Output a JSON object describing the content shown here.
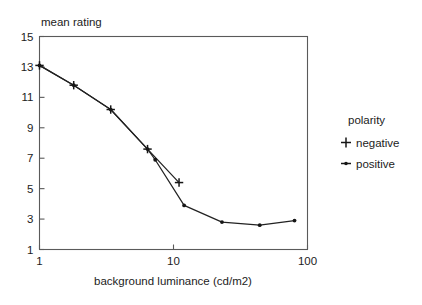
{
  "chart_data": {
    "type": "line",
    "title": "",
    "xlabel": "background luminance (cd/m2)",
    "ylabel": "mean rating",
    "xscale": "log",
    "yscale": "linear",
    "xlim": [
      1,
      100
    ],
    "ylim": [
      1,
      15
    ],
    "xticks": [
      "1",
      "10",
      "100"
    ],
    "xtick_values": [
      1,
      10,
      100
    ],
    "yticks": [
      "15",
      "13",
      "11",
      "9",
      "7",
      "5",
      "3",
      "1"
    ],
    "ytick_values": [
      15,
      13,
      11,
      9,
      7,
      5,
      3,
      1
    ],
    "grid": false,
    "legend_position": "right",
    "legend_title": "polarity",
    "series": [
      {
        "name": "negative",
        "marker": "plus",
        "x": [
          1.0,
          1.8,
          3.4,
          6.4,
          11.0
        ],
        "y": [
          13.1,
          11.8,
          10.2,
          7.6,
          5.4
        ]
      },
      {
        "name": "positive",
        "marker": "dot",
        "x": [
          1.0,
          1.8,
          3.4,
          6.4,
          7.3,
          12.0,
          23.0,
          44.0,
          80.0
        ],
        "y": [
          13.1,
          11.8,
          10.2,
          7.6,
          6.9,
          3.9,
          2.8,
          2.6,
          2.9
        ]
      }
    ]
  },
  "axes": {
    "y_title": "mean rating",
    "x_title": "background luminance (cd/m2)"
  },
  "legend": {
    "title": "polarity",
    "items": [
      {
        "label": "negative",
        "marker": "plus-marker"
      },
      {
        "label": "positive",
        "marker": "dot-line-marker"
      }
    ]
  },
  "colors": {
    "background": "#ffffff",
    "line": "#222222",
    "axis": "#5a5a5a",
    "text": "#1c1c1c"
  }
}
